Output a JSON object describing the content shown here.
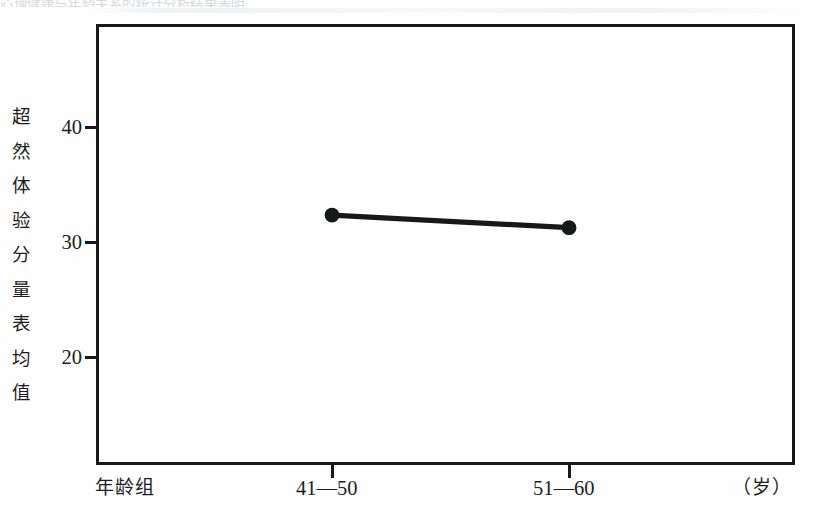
{
  "figure": {
    "scan_artifact_text": "心理健康与年龄关系的统计分析结果表明",
    "background_color": "#ffffff",
    "frame_color": "#16181a",
    "series_color": "#16181a"
  },
  "chart_data": {
    "type": "line",
    "title": "",
    "xlabel": "年龄组",
    "xunit": "（岁）",
    "ylabel": "超然体验分量表均值",
    "categories": [
      "41—50",
      "51—60"
    ],
    "values": [
      32.3,
      31.2
    ],
    "series": [
      {
        "name": "超然体验分量表均值",
        "values": [
          32.3,
          31.2
        ],
        "marker": "filled-circle",
        "color": "#16181a"
      }
    ],
    "ylim": [
      13.3,
      51.4
    ],
    "yticks": [
      40,
      30,
      20
    ],
    "ytick_labels": [
      "40",
      "30",
      "20"
    ],
    "xtick_labels": [
      "41—50",
      "51—60"
    ],
    "grid": false,
    "legend": false,
    "legend_position": "none",
    "annotations": []
  },
  "y_axis": {
    "title_chars": [
      "超",
      "然",
      "体",
      "验",
      "分",
      "量",
      "表",
      "均",
      "值"
    ],
    "ticks": [
      {
        "label": "40",
        "value": 40
      },
      {
        "label": "30",
        "value": 30
      },
      {
        "label": "20",
        "value": 20
      }
    ]
  },
  "x_axis": {
    "axis_name": "年龄组",
    "unit": "（岁）",
    "ticks": [
      {
        "label": "41—50"
      },
      {
        "label": "51—60"
      }
    ]
  }
}
